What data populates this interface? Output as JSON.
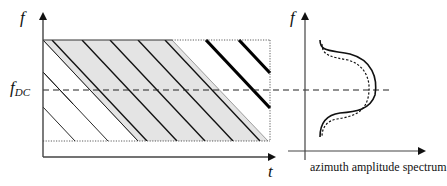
{
  "diagram": {
    "type": "time-frequency illumination diagram with azimuth spectrum",
    "left_panel": {
      "y_axis_label": "f",
      "x_axis_label": "t",
      "reference_line_label": "f",
      "reference_line_subscript": "DC",
      "reference_line_style": "dashed",
      "regions": [
        {
          "name": "illuminated band",
          "fill": "#e4e4e4",
          "style": "gray parallelogram with thin diagonal lines"
        },
        {
          "name": "aliased lines top-right",
          "style": "thick black diagonal lines"
        },
        {
          "name": "aliased lines bottom-left",
          "style": "thin black diagonal lines"
        },
        {
          "name": "processing window",
          "style": "dotted rectangle"
        }
      ]
    },
    "right_panel": {
      "y_axis_label": "f",
      "x_axis_label": "azimuth amplitude spectrum",
      "curves": [
        {
          "name": "spectrum solid",
          "style": "solid"
        },
        {
          "name": "spectrum shifted",
          "style": "dotted"
        }
      ]
    },
    "colors": {
      "ink": "#111111",
      "band_fill": "#e4e4e4",
      "axis": "#555555"
    }
  }
}
